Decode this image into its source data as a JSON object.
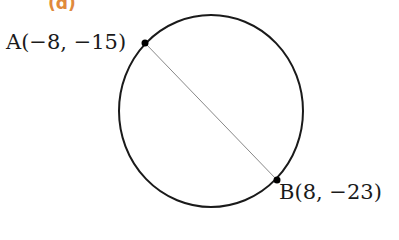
{
  "part_label": "(d)",
  "points": {
    "A": {
      "label": "A(−8, −15)",
      "x": -8,
      "y": -15
    },
    "B": {
      "label": "B(8, −23)",
      "x": 8,
      "y": -23
    }
  },
  "figure": {
    "shape": "circle",
    "segment": "AB (diameter)",
    "colors": {
      "part_label": "#e08a3c",
      "stroke": "#1a1a1a",
      "segment": "#888888"
    }
  }
}
